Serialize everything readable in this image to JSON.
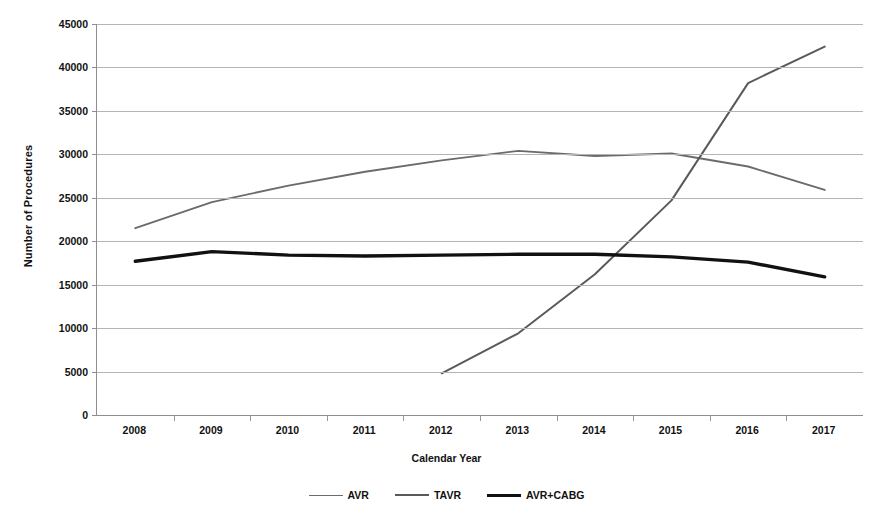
{
  "chart_data": {
    "type": "line",
    "title": "",
    "xlabel": "Calendar Year",
    "ylabel": "Number of Procedures",
    "categories": [
      2008,
      2009,
      2010,
      2011,
      2012,
      2013,
      2014,
      2015,
      2016,
      2017
    ],
    "x_tick_labels": [
      "2008",
      "2009",
      "2010",
      "2011",
      "2012",
      "2013",
      "2014",
      "2015",
      "2016",
      "2017"
    ],
    "y_tick_labels": [
      "0",
      "5000",
      "10000",
      "15000",
      "20000",
      "25000",
      "30000",
      "35000",
      "40000",
      "45000"
    ],
    "y_ticks": [
      0,
      5000,
      10000,
      15000,
      20000,
      25000,
      30000,
      35000,
      40000,
      45000
    ],
    "ylim": [
      0,
      45000
    ],
    "grid": "horizontal",
    "legend_position": "bottom",
    "series": [
      {
        "name": "AVR",
        "color": "#6b6b6b",
        "width": 1.9,
        "x": [
          2008,
          2009,
          2010,
          2011,
          2012,
          2013,
          2014,
          2015,
          2016,
          2017
        ],
        "values": [
          21500,
          24500,
          26400,
          28000,
          29300,
          30400,
          29800,
          30100,
          28600,
          25900
        ]
      },
      {
        "name": "TAVR",
        "color": "#5a5a5a",
        "width": 2.0,
        "x": [
          2012,
          2013,
          2014,
          2015,
          2016,
          2017
        ],
        "values": [
          4800,
          9400,
          16200,
          24700,
          38200,
          42400
        ]
      },
      {
        "name": "AVR+CABG",
        "color": "#111111",
        "width": 3.4,
        "x": [
          2008,
          2009,
          2010,
          2011,
          2012,
          2013,
          2014,
          2015,
          2016,
          2017
        ],
        "values": [
          17700,
          18800,
          18400,
          18300,
          18400,
          18500,
          18500,
          18200,
          17600,
          15900
        ]
      }
    ]
  },
  "legend": {
    "items": [
      {
        "label": "AVR"
      },
      {
        "label": "TAVR"
      },
      {
        "label": "AVR+CABG"
      }
    ]
  },
  "axis": {
    "x_title": "Calendar Year",
    "y_title": "Number of Procedures"
  }
}
